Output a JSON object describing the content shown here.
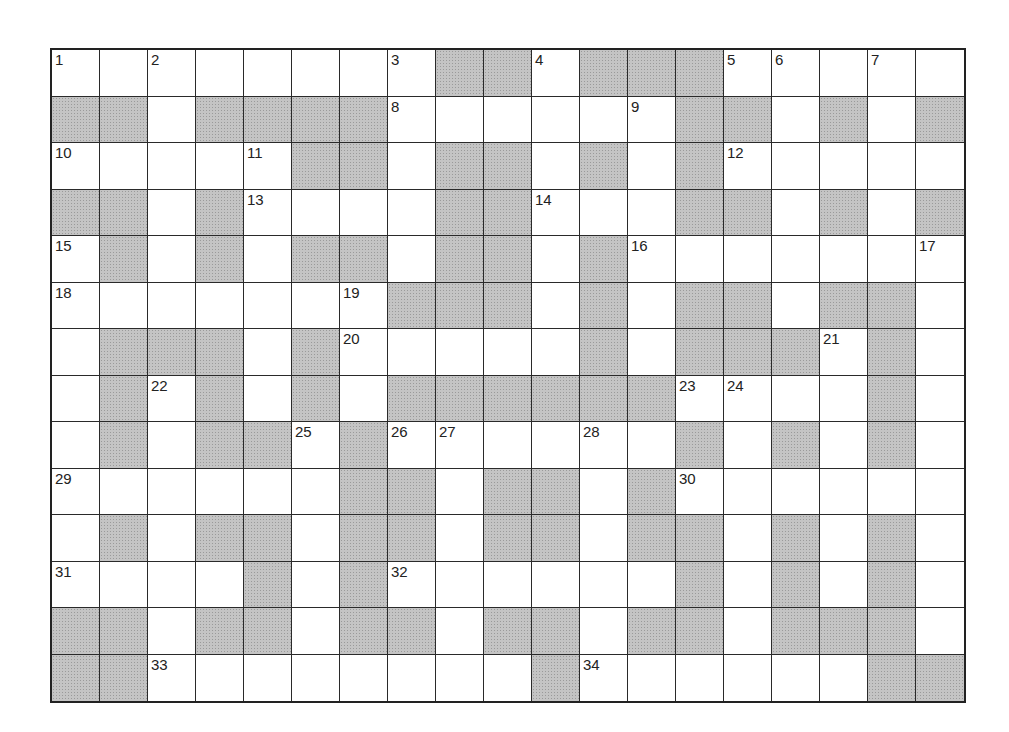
{
  "puzzle": {
    "rows": 14,
    "cols": 19,
    "colors": {
      "block": "#c4c4c4",
      "line": "#2a2a2a",
      "white": "#ffffff"
    },
    "layout": [
      "WWWWWWWWBBWBBBWWWWW",
      "BBWBBBBWWWWWWBBWBWB",
      "WWWWWBBWBBWBWBWWWWW",
      "BBWBWWWWBBWWWBBWBWB",
      "WBWBWBBWBBWBWWWWWWW",
      "WWWWWWWBBBWBWBBWBBW",
      "WBBBWBWWWWWBWBBBWBW",
      "WBWBWBWBBBBBBWWWWBW",
      "WBWBBWBWWWWWWBWBWBW",
      "WWWWWWBBWBBWBWWWWWW",
      "WBWBBWBBWBBWBBWBWBW",
      "WWWWBWBWWWWWWBWBWBW",
      "BBWBBWBBWBBWBBWBBBW",
      "BBWWWWWWWWBWWWWWWBB"
    ],
    "numbers": [
      {
        "r": 0,
        "c": 0,
        "n": "1"
      },
      {
        "r": 0,
        "c": 2,
        "n": "2"
      },
      {
        "r": 0,
        "c": 7,
        "n": "3"
      },
      {
        "r": 0,
        "c": 10,
        "n": "4"
      },
      {
        "r": 0,
        "c": 14,
        "n": "5"
      },
      {
        "r": 0,
        "c": 15,
        "n": "6"
      },
      {
        "r": 0,
        "c": 17,
        "n": "7"
      },
      {
        "r": 1,
        "c": 7,
        "n": "8"
      },
      {
        "r": 1,
        "c": 12,
        "n": "9"
      },
      {
        "r": 2,
        "c": 0,
        "n": "10"
      },
      {
        "r": 2,
        "c": 4,
        "n": "11"
      },
      {
        "r": 2,
        "c": 14,
        "n": "12"
      },
      {
        "r": 3,
        "c": 4,
        "n": "13"
      },
      {
        "r": 3,
        "c": 10,
        "n": "14"
      },
      {
        "r": 4,
        "c": 0,
        "n": "15"
      },
      {
        "r": 4,
        "c": 12,
        "n": "16"
      },
      {
        "r": 4,
        "c": 18,
        "n": "17"
      },
      {
        "r": 5,
        "c": 0,
        "n": "18"
      },
      {
        "r": 5,
        "c": 6,
        "n": "19"
      },
      {
        "r": 6,
        "c": 6,
        "n": "20"
      },
      {
        "r": 6,
        "c": 16,
        "n": "21"
      },
      {
        "r": 7,
        "c": 2,
        "n": "22"
      },
      {
        "r": 7,
        "c": 13,
        "n": "23"
      },
      {
        "r": 7,
        "c": 14,
        "n": "24"
      },
      {
        "r": 8,
        "c": 5,
        "n": "25"
      },
      {
        "r": 8,
        "c": 7,
        "n": "26"
      },
      {
        "r": 8,
        "c": 8,
        "n": "27"
      },
      {
        "r": 8,
        "c": 11,
        "n": "28"
      },
      {
        "r": 9,
        "c": 0,
        "n": "29"
      },
      {
        "r": 9,
        "c": 13,
        "n": "30"
      },
      {
        "r": 11,
        "c": 0,
        "n": "31"
      },
      {
        "r": 11,
        "c": 7,
        "n": "32"
      },
      {
        "r": 13,
        "c": 2,
        "n": "33"
      },
      {
        "r": 13,
        "c": 11,
        "n": "34"
      }
    ]
  }
}
